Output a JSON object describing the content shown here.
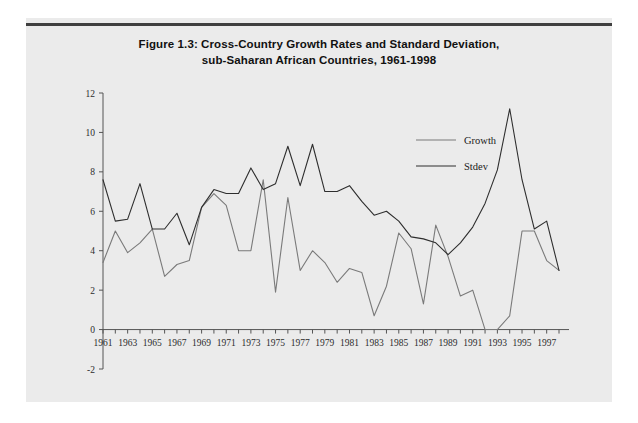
{
  "figure": {
    "title_line1": "Figure 1.3: Cross-Country Growth Rates and Standard Deviation,",
    "title_line2": "sub-Saharan  African Countries, 1961-1998"
  },
  "colors": {
    "page_background": "#ffffff",
    "panel_background": "#ebebeb",
    "rule": "#3f3f3f",
    "axis": "#555555",
    "growth_line": "#7a7a7a",
    "stdev_line": "#2e2e2e",
    "text": "#111111"
  },
  "chart_data": {
    "type": "line",
    "title": "Figure 1.3: Cross-Country Growth Rates and Standard Deviation, sub-Saharan  African Countries, 1961-1998",
    "xlabel": "",
    "ylabel": "",
    "grid": false,
    "legend_position": "top-right",
    "ylim": [
      -2,
      12
    ],
    "yticks": [
      -2,
      0,
      2,
      4,
      6,
      8,
      10,
      12
    ],
    "ytick_labels": [
      "-2",
      "0",
      "2",
      "4",
      "6",
      "8",
      "10",
      "12"
    ],
    "xlim": [
      1961,
      1998
    ],
    "x": [
      1961,
      1962,
      1963,
      1964,
      1965,
      1966,
      1967,
      1968,
      1969,
      1970,
      1971,
      1972,
      1973,
      1974,
      1975,
      1976,
      1977,
      1978,
      1979,
      1980,
      1981,
      1982,
      1983,
      1984,
      1985,
      1986,
      1987,
      1988,
      1989,
      1990,
      1991,
      1992,
      1993,
      1994,
      1995,
      1996,
      1997,
      1998
    ],
    "xticks": [
      1961,
      1963,
      1965,
      1967,
      1969,
      1971,
      1973,
      1975,
      1977,
      1979,
      1981,
      1983,
      1985,
      1987,
      1989,
      1991,
      1993,
      1995,
      1997
    ],
    "xtick_labels": [
      "1961",
      "1963",
      "1965",
      "1967",
      "1969",
      "1971",
      "1973",
      "1975",
      "1977",
      "1979",
      "1981",
      "1983",
      "1985",
      "1987",
      "1989",
      "1991",
      "1993",
      "1995",
      "1997"
    ],
    "series": [
      {
        "name": "Growth",
        "color": "#7a7a7a",
        "values": [
          3.4,
          5.0,
          3.9,
          4.4,
          5.1,
          2.7,
          3.3,
          3.5,
          6.2,
          6.9,
          6.3,
          4.0,
          4.0,
          7.6,
          1.9,
          6.7,
          3.0,
          4.0,
          3.4,
          2.4,
          3.1,
          2.9,
          0.7,
          2.2,
          4.9,
          4.1,
          1.3,
          5.3,
          3.7,
          1.7,
          2.0,
          0.0,
          0.0,
          0.7,
          5.0,
          5.0,
          3.5,
          3.0
        ]
      },
      {
        "name": "Stdev",
        "color": "#2e2e2e",
        "values": [
          7.6,
          5.5,
          5.6,
          7.4,
          5.1,
          5.1,
          5.9,
          4.3,
          6.2,
          7.1,
          6.9,
          6.9,
          8.2,
          7.1,
          7.4,
          9.3,
          7.3,
          9.4,
          7.0,
          7.0,
          7.3,
          6.5,
          5.8,
          6.0,
          5.5,
          4.7,
          4.6,
          4.4,
          3.8,
          4.4,
          5.2,
          6.4,
          8.1,
          11.2,
          7.6,
          5.1,
          5.5,
          3.0
        ]
      }
    ]
  },
  "legend": {
    "items": [
      {
        "label": "Growth"
      },
      {
        "label": "Stdev"
      }
    ]
  }
}
